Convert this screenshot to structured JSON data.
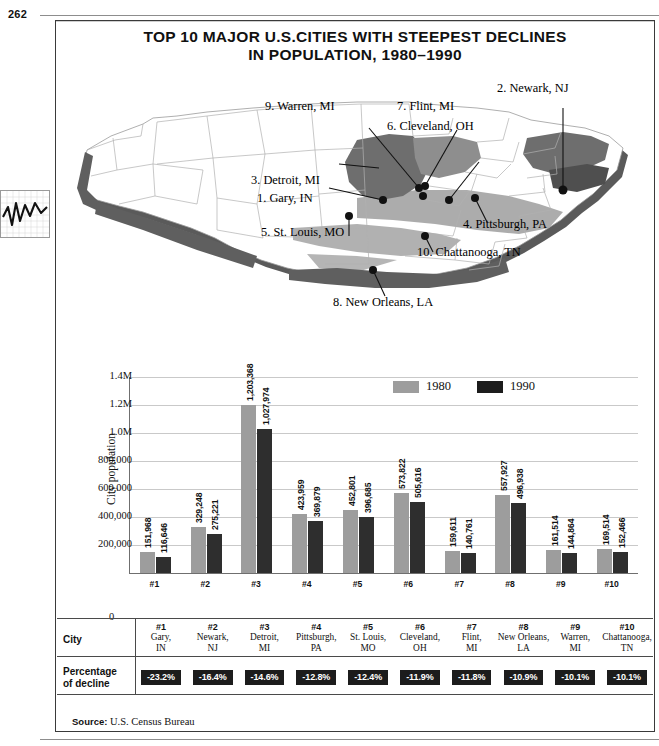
{
  "folio": "262",
  "title": {
    "line1": "TOP 10 MAJOR U.S.CITIES WITH STEEPEST DECLINES",
    "line2": "IN POPULATION, 1980–1990"
  },
  "margin_thumbnail": {
    "icon": "line-chart-thumbnail"
  },
  "map": {
    "region": "United States",
    "callouts": [
      {
        "n": "1",
        "label": "1. Gary, IN"
      },
      {
        "n": "2",
        "label": "2. Newark, NJ"
      },
      {
        "n": "3",
        "label": "3. Detroit, MI"
      },
      {
        "n": "4",
        "label": "4. Pittsburgh, PA"
      },
      {
        "n": "5",
        "label": "5. St. Louis, MO"
      },
      {
        "n": "6",
        "label": "6. Cleveland, OH"
      },
      {
        "n": "7",
        "label": "7. Flint, MI"
      },
      {
        "n": "8",
        "label": "8. New Orleans, LA"
      },
      {
        "n": "9",
        "label": "9. Warren, MI"
      },
      {
        "n": "10",
        "label": "10. Chattanooga, TN"
      }
    ]
  },
  "chart_data": {
    "type": "bar",
    "title": "TOP 10 MAJOR U.S.CITIES WITH STEEPEST DECLINES IN POPULATION, 1980–1990",
    "xlabel": "",
    "ylabel": "City population",
    "ylim": [
      0,
      1400000
    ],
    "grid": true,
    "legend_position": "top-right",
    "ytick_labels": [
      "1.4M",
      "1.2M",
      "1.0M",
      "800,000",
      "600,000",
      "400,000",
      "200,000",
      "0"
    ],
    "ytick_values": [
      1400000,
      1200000,
      1000000,
      800000,
      600000,
      400000,
      200000,
      0
    ],
    "categories": [
      "#1",
      "#2",
      "#3",
      "#4",
      "#5",
      "#6",
      "#7",
      "#8",
      "#9",
      "#10"
    ],
    "series": [
      {
        "name": "1980",
        "color": "#9d9d9d",
        "values": [
          151968,
          329248,
          1203368,
          423959,
          452801,
          573822,
          159611,
          557927,
          161514,
          169514
        ],
        "labels": [
          "151,968",
          "329,248",
          "1,203,368",
          "423,959",
          "452,801",
          "573,822",
          "159,611",
          "557,927",
          "161,514",
          "169,514"
        ]
      },
      {
        "name": "1990",
        "color": "#2e2e2e",
        "values": [
          116646,
          275221,
          1027974,
          369879,
          396685,
          505616,
          140761,
          496938,
          144864,
          152466
        ],
        "labels": [
          "116,646",
          "275,221",
          "1,027,974",
          "369,879",
          "396,685",
          "505,616",
          "140,761",
          "496,938",
          "144,864",
          "152,466"
        ]
      }
    ]
  },
  "table": {
    "row_labels": {
      "city": "City",
      "pct": "Percentage\nof decline",
      "pct_line1": "Percentage",
      "pct_line2": "of decline"
    },
    "ranks": [
      "#1",
      "#2",
      "#3",
      "#4",
      "#5",
      "#6",
      "#7",
      "#8",
      "#9",
      "#10"
    ],
    "cities": [
      {
        "name1": "Gary,",
        "name2": "IN"
      },
      {
        "name1": "Newark,",
        "name2": "NJ"
      },
      {
        "name1": "Detroit,",
        "name2": "MI"
      },
      {
        "name1": "Pittsburgh,",
        "name2": "PA"
      },
      {
        "name1": "St. Louis,",
        "name2": "MO"
      },
      {
        "name1": "Cleveland,",
        "name2": "OH"
      },
      {
        "name1": "Flint,",
        "name2": "MI"
      },
      {
        "name1": "New Orleans,",
        "name2": "LA"
      },
      {
        "name1": "Warren,",
        "name2": "MI"
      },
      {
        "name1": "Chattanooga,",
        "name2": "TN"
      }
    ],
    "percentages": [
      "-23.2%",
      "-16.4%",
      "-14.6%",
      "-12.8%",
      "-12.4%",
      "-11.9%",
      "-11.8%",
      "-10.9%",
      "-10.1%",
      "-10.1%"
    ]
  },
  "source": {
    "label": "Source:",
    "text": "U.S. Census Bureau"
  },
  "colors": {
    "series_1980": "#9d9d9d",
    "series_1990": "#2e2e2e",
    "badge_bg": "#1c1c1c",
    "map_light": "#ffffff",
    "map_mid": "#a8a8a8",
    "map_dark": "#6e6e6e",
    "map_shadow": "#5a5a5a",
    "frame": "#3a3a3a"
  }
}
